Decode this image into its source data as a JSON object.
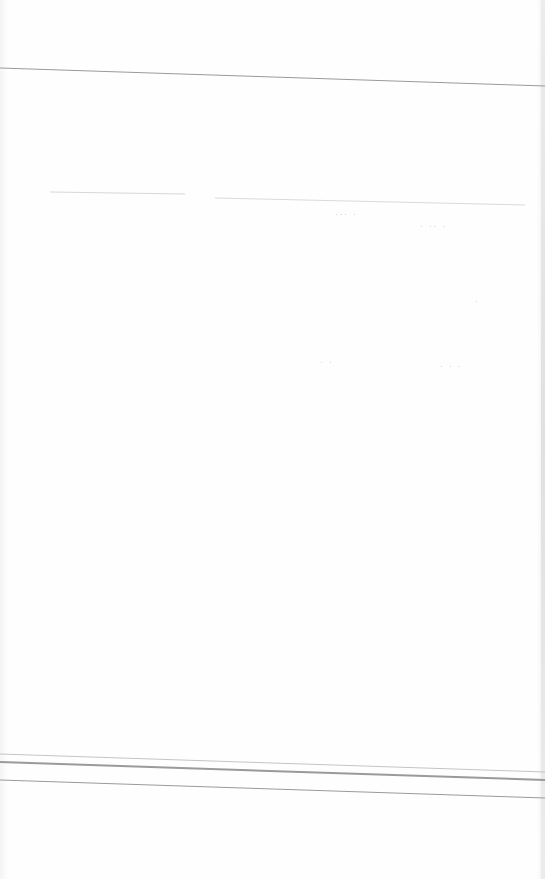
{
  "document": {
    "type": "scanned blank form page",
    "rules": [
      {
        "name": "top-rule",
        "y": 68,
        "y_end": 86,
        "color": "#9a9a9a",
        "weight": 1
      },
      {
        "name": "faint-rule-left",
        "x": 50,
        "x_end": 185,
        "y": 192,
        "color": "#d8d8d8",
        "weight": 1
      },
      {
        "name": "faint-rule-right",
        "x": 215,
        "x_end": 525,
        "y": 198,
        "y_end": 205,
        "color": "#dadada",
        "weight": 1
      },
      {
        "name": "bottom-rule-1",
        "y": 754,
        "y_end": 772,
        "color": "#c4c4c4",
        "weight": 1
      },
      {
        "name": "bottom-rule-2",
        "y": 762,
        "y_end": 780,
        "color": "#9a9a9a",
        "weight": 2
      },
      {
        "name": "bottom-rule-3",
        "y": 780,
        "y_end": 798,
        "color": "#9a9a9a",
        "weight": 1
      }
    ],
    "bleed_through_marks": [
      {
        "name": "smudge-1",
        "x": 335,
        "y": 210,
        "text": "··· ·"
      },
      {
        "name": "smudge-2",
        "x": 420,
        "y": 222,
        "text": "· ·· ·"
      },
      {
        "name": "smudge-3",
        "x": 475,
        "y": 297,
        "text": "·"
      },
      {
        "name": "smudge-4",
        "x": 320,
        "y": 358,
        "text": "· ·"
      },
      {
        "name": "smudge-5",
        "x": 440,
        "y": 362,
        "text": "· · ·"
      }
    ]
  }
}
